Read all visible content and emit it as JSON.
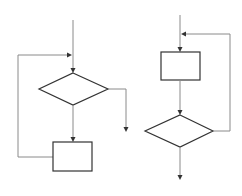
{
  "diagram": {
    "type": "flowchart-pair",
    "colors": {
      "background": "#ffffff",
      "shape_stroke": "#333333",
      "connector_stroke": "#8a8a8a",
      "arrowhead": "#333333"
    },
    "flowcharts": [
      {
        "id": "left",
        "description": "pre-test loop (while): decision first, then process, loop back above decision",
        "nodes": [
          {
            "id": "decision",
            "shape": "diamond",
            "label": ""
          },
          {
            "id": "process",
            "shape": "rectangle",
            "label": ""
          }
        ],
        "edges": [
          {
            "from": "entry",
            "to": "decision"
          },
          {
            "from": "decision",
            "to": "process"
          },
          {
            "from": "decision",
            "to": "exit"
          },
          {
            "from": "process",
            "to": "decision",
            "kind": "loop-back"
          }
        ]
      },
      {
        "id": "right",
        "description": "post-test loop (do-while): process first, then decision, loop back above process",
        "nodes": [
          {
            "id": "process",
            "shape": "rectangle",
            "label": ""
          },
          {
            "id": "decision",
            "shape": "diamond",
            "label": ""
          }
        ],
        "edges": [
          {
            "from": "entry",
            "to": "process"
          },
          {
            "from": "process",
            "to": "decision"
          },
          {
            "from": "decision",
            "to": "process",
            "kind": "loop-back"
          },
          {
            "from": "decision",
            "to": "exit"
          }
        ]
      }
    ]
  }
}
